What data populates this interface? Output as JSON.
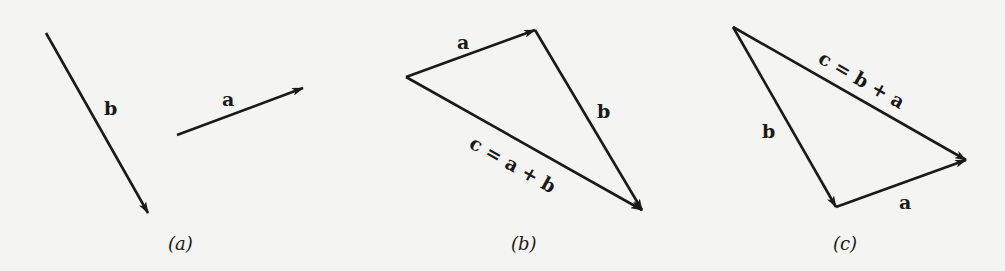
{
  "figure": {
    "colors": {
      "background": "#f4f4f2",
      "ink": "#1a1a1a"
    },
    "panels": [
      {
        "id": "a",
        "caption": "(a)",
        "vectors": [
          {
            "name": "b",
            "label": "b",
            "from": [
              46,
              33
            ],
            "to": [
              148,
              213
            ],
            "label_pos": [
              104,
              115
            ]
          },
          {
            "name": "a",
            "label": "a",
            "from": [
              177,
              135
            ],
            "to": [
              303,
              88
            ],
            "label_pos": [
              222,
              106
            ]
          }
        ],
        "caption_pos": [
          168,
          250
        ]
      },
      {
        "id": "b",
        "caption": "(b)",
        "vectors": [
          {
            "name": "a",
            "label": "a",
            "from": [
              406,
              77
            ],
            "to": [
              535,
              30
            ],
            "label_pos": [
              457,
              49
            ]
          },
          {
            "name": "b",
            "label": "b",
            "from": [
              535,
              30
            ],
            "to": [
              642,
              210
            ],
            "label_pos": [
              597,
              118
            ]
          },
          {
            "name": "c",
            "label": "c = a + b",
            "from": [
              406,
              77
            ],
            "to": [
              642,
              210
            ],
            "label_pos": [
              468,
              150
            ]
          }
        ],
        "caption_pos": [
          511,
          250
        ]
      },
      {
        "id": "c",
        "caption": "(c)",
        "vectors": [
          {
            "name": "b",
            "label": "b",
            "from": [
              733,
              27
            ],
            "to": [
              836,
              207
            ],
            "label_pos": [
              762,
              138
            ]
          },
          {
            "name": "a",
            "label": "a",
            "from": [
              836,
              207
            ],
            "to": [
              966,
              160
            ],
            "label_pos": [
              899,
              209
            ]
          },
          {
            "name": "c",
            "label": "c = b + a",
            "from": [
              733,
              27
            ],
            "to": [
              966,
              160
            ],
            "label_pos": [
              818,
              60
            ]
          }
        ],
        "caption_pos": [
          833,
          250
        ]
      }
    ]
  }
}
